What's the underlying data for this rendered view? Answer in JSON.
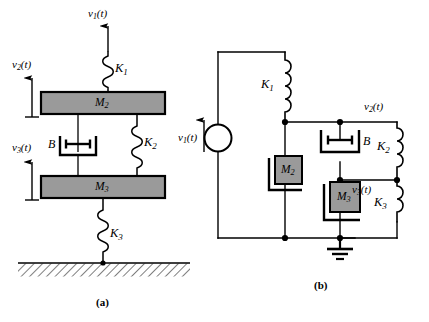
{
  "figure": {
    "width": 429,
    "height": 322,
    "background": "#ffffff",
    "stroke_color": "#000000",
    "mass_fill": "#9a9a9a"
  },
  "panel_a": {
    "caption": "(a)",
    "type": "mechanical-system",
    "labels": {
      "k1": "K",
      "k1_sub": "1",
      "k2": "K",
      "k2_sub": "2",
      "k3": "K",
      "k3_sub": "3",
      "m2": "M",
      "m2_sub": "2",
      "m3": "M",
      "m3_sub": "3",
      "damper": "B",
      "v1": "v",
      "v1_sub": "1",
      "v1_arg": "(t)",
      "v2": "v",
      "v2_sub": "2",
      "v2_arg": "(t)",
      "v3": "v",
      "v3_sub": "3",
      "v3_arg": "(t)"
    }
  },
  "panel_b": {
    "caption": "(b)",
    "type": "electrical-analog-circuit",
    "labels": {
      "k1": "K",
      "k1_sub": "1",
      "k2": "K",
      "k2_sub": "2",
      "k3": "K",
      "k3_sub": "3",
      "m2": "M",
      "m2_sub": "2",
      "m3": "M",
      "m3_sub": "3",
      "damper": "B",
      "v1": "v",
      "v1_sub": "1",
      "v1_arg": "(t)",
      "v2": "v",
      "v2_sub": "2",
      "v2_arg": "(t)",
      "v3": "v",
      "v3_sub": "3",
      "v3_arg": "(t)"
    }
  }
}
